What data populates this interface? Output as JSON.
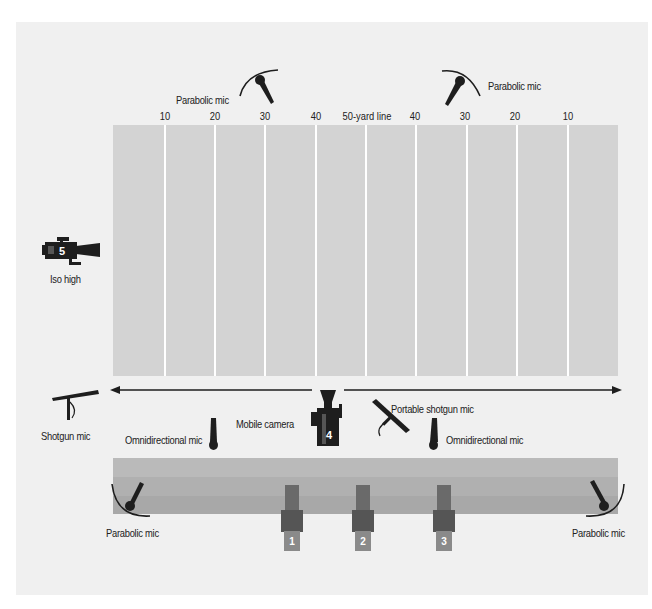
{
  "diagram": {
    "title": "",
    "colors": {
      "panel": "#f0f0f0",
      "field": "#d3d3d3",
      "yard_line": "#ffffff",
      "stands_top": "#bababa",
      "stands_mid": "#b0b0b0",
      "stands_bottom": "#a8a8a8",
      "equipment": "#1e1e1e",
      "camera_body": "#555555",
      "camera_base": "#8a8a8a"
    },
    "yard_labels": [
      "10",
      "20",
      "30",
      "40",
      "50-yard line",
      "40",
      "30",
      "20",
      "10"
    ],
    "mics": {
      "parabolic_top_left": "Parabolic mic",
      "parabolic_top_right": "Parabolic mic",
      "parabolic_bottom_left": "Parabolic mic",
      "parabolic_bottom_right": "Parabolic mic",
      "shotgun": "Shotgun mic",
      "omni_left": "Omnidirectional mic",
      "omni_right": "Omnidirectional mic",
      "portable_shotgun": "Portable shotgun mic"
    },
    "cameras": {
      "iso_high_label": "Iso high",
      "iso_high_number": "5",
      "mobile_label": "Mobile camera",
      "mobile_number": "4",
      "sideline": [
        {
          "number": "1"
        },
        {
          "number": "2"
        },
        {
          "number": "3"
        }
      ]
    }
  }
}
